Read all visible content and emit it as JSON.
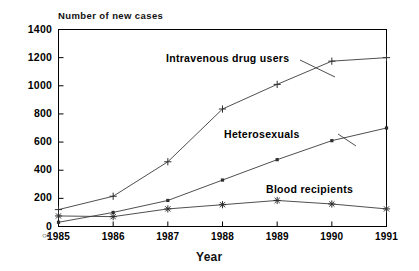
{
  "chart_data": {
    "type": "line",
    "title": "",
    "ylabel": "Number of new cases",
    "xlabel": "Year",
    "categories": [
      "1985",
      "1986",
      "1987",
      "1988",
      "1989",
      "1990",
      "1991"
    ],
    "x": [
      1985,
      1986,
      1987,
      1988,
      1989,
      1990,
      1991
    ],
    "ylim": [
      0,
      1400
    ],
    "yticks": [
      0,
      200,
      400,
      600,
      800,
      1000,
      1200,
      1400
    ],
    "ytick_labels": [
      "0",
      "200",
      "400",
      "600",
      "800",
      "1000",
      "1200",
      "1400"
    ],
    "grid": false,
    "legend": "inline-annotations",
    "series": [
      {
        "name": "Intravenous drug users",
        "marker": "plus",
        "values": [
          120,
          215,
          460,
          835,
          1010,
          1175,
          1200
        ]
      },
      {
        "name": "Heterosexuals",
        "marker": "square",
        "values": [
          30,
          100,
          185,
          330,
          475,
          610,
          700
        ]
      },
      {
        "name": "Blood recipients",
        "marker": "asterisk",
        "values": [
          75,
          70,
          125,
          155,
          185,
          160,
          125
        ]
      }
    ],
    "annotations": [
      {
        "text": "Intravenous drug users",
        "series": "Intravenous drug users"
      },
      {
        "text": "Heterosexuals",
        "series": "Heterosexuals"
      },
      {
        "text": "Blood recipients",
        "series": "Blood recipients"
      }
    ],
    "colors": {
      "line": "#3b3b3b",
      "axis": "#000000",
      "text": "#111111",
      "background": "#ffffff"
    }
  },
  "axes": {
    "y_title": "Number of new cases",
    "x_title": "Year",
    "origin_glyph": "○▪"
  },
  "labels": {
    "iv_drug_users": "Intravenous drug users",
    "heterosexuals": "Heterosexuals",
    "blood_recipients": "Blood recipients"
  }
}
